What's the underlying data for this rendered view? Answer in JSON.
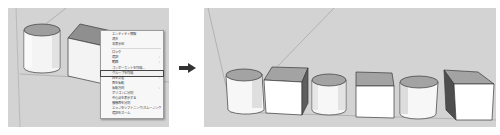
{
  "left_panel": {
    "description": "SketchUp viewport with cylinder and box, right-click context menu open",
    "context_menu": {
      "items": [
        {
          "label": "エンティティ情報",
          "submenu": false
        },
        {
          "label": "消去",
          "submenu": false
        },
        {
          "label": "非表示化",
          "submenu": false
        },
        {
          "separator": true
        },
        {
          "label": "ロック",
          "submenu": false
        },
        {
          "label": "選択",
          "submenu": true
        },
        {
          "label": "範囲",
          "submenu": true
        },
        {
          "label": "コンポーネントを作成...",
          "submenu": false
        },
        {
          "label": "グループを作成",
          "submenu": false,
          "highlighted": true
        },
        {
          "label": "面を交差",
          "submenu": true
        },
        {
          "label": "面を反転",
          "submenu": false
        },
        {
          "label": "反転方向",
          "submenu": true
        },
        {
          "label": "ポリゴンに分割",
          "submenu": false
        },
        {
          "label": "中心点を表示する",
          "submenu": false
        },
        {
          "label": "接触面を分割",
          "submenu": false
        },
        {
          "label": "エッジをソフトニング/スムージング",
          "submenu": false
        },
        {
          "label": "選択をズーム",
          "submenu": false
        }
      ],
      "submenu_glyph": "›"
    }
  },
  "arrow": {
    "icon": "arrow-right-icon",
    "color": "#333333"
  },
  "right_panel": {
    "description": "SketchUp viewport with six shapes in a row",
    "shapes": [
      "cylinder",
      "box",
      "cylinder",
      "box",
      "cylinder",
      "box"
    ]
  },
  "colors": {
    "viewport_bg": "#d3d3d3",
    "face_light": "#ffffff",
    "face_top": "#b0b0b0",
    "face_dark": "#5a5a5a",
    "edge": "#3a3a3a",
    "menu_bg": "#f7f7f7"
  }
}
